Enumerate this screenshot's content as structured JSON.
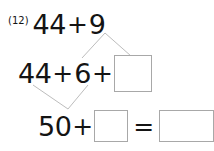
{
  "problem": {
    "number_label": "(12)",
    "rows": {
      "top": {
        "first_addend": "44",
        "plus": "+",
        "second_addend": "9"
      },
      "middle": {
        "first_addend": "44",
        "plus_1": "+",
        "second_addend": "6",
        "plus_2": "+",
        "blank_value": ""
      },
      "bottom": {
        "first_addend": "50",
        "plus": "+",
        "blank_value": "",
        "equals": "=",
        "result_value": ""
      }
    }
  },
  "colors": {
    "ink": "#141414",
    "box_border": "#a8a8a8",
    "connector_line": "#bdbdbd",
    "background": "#ffffff"
  }
}
